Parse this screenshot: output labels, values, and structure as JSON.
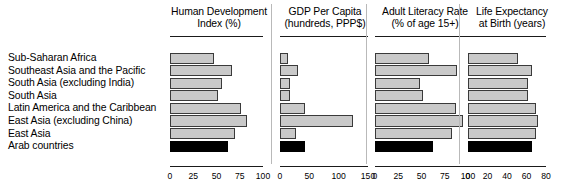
{
  "row_labels": [
    "Sub-Saharan Africa",
    "Southeast Asia and the Pacific",
    "South Asia (excluding India)",
    "South Asia",
    "Latin America and the Caribbean",
    "East Asia (excluding China)",
    "East Asia",
    "Arab countries"
  ],
  "highlight_row": "Arab countries",
  "colors": {
    "bar_fill": "#c9c9c9",
    "bar_border": "#3a3a3a",
    "highlight_fill": "#000000",
    "rule": "#1a1a1a",
    "text": "#000000"
  },
  "chart_data": [
    {
      "type": "bar",
      "title": "Human Development Index (%)",
      "title_lines": [
        "Human Development",
        "Index (%)"
      ],
      "xlabel": "",
      "ylabel": "",
      "orientation": "horizontal",
      "xlim": [
        0,
        100
      ],
      "ticks": [
        0,
        25,
        50,
        75,
        100
      ],
      "tick_labels": [
        "0",
        "25",
        "50",
        "75",
        "100"
      ],
      "grid": false,
      "categories": [
        "Sub-Saharan Africa",
        "Southeast Asia and the Pacific",
        "South Asia (excluding India)",
        "South Asia",
        "Latin America and the Caribbean",
        "East Asia (excluding China)",
        "East Asia",
        "Arab countries"
      ],
      "values": [
        47,
        67,
        56,
        52,
        76,
        83,
        70,
        62
      ]
    },
    {
      "type": "bar",
      "title": "GDP Per Capita (hundreds, PPP$)",
      "title_lines": [
        "GDP Per Capita",
        "(hundreds, PPP$)"
      ],
      "xlabel": "",
      "ylabel": "",
      "orientation": "horizontal",
      "xlim": [
        0,
        150
      ],
      "ticks": [
        0,
        50,
        100,
        150
      ],
      "tick_labels": [
        "0",
        "50",
        "100",
        "150"
      ],
      "grid": false,
      "categories": [
        "Sub-Saharan Africa",
        "Southeast Asia and the Pacific",
        "South Asia (excluding India)",
        "South Asia",
        "Latin America and the Caribbean",
        "East Asia (excluding China)",
        "East Asia",
        "Arab countries"
      ],
      "values": [
        14,
        31,
        17,
        17,
        43,
        125,
        28,
        42
      ]
    },
    {
      "type": "bar",
      "title": "Adult Literacy Rate (% of age 15+)",
      "title_lines": [
        "Adult Literacy Rate",
        "(% of age 15+)"
      ],
      "xlabel": "",
      "ylabel": "",
      "orientation": "horizontal",
      "xlim": [
        0,
        100
      ],
      "ticks": [
        0,
        25,
        50,
        75,
        100
      ],
      "tick_labels": [
        "0",
        "25",
        "50",
        "75",
        "100"
      ],
      "grid": false,
      "categories": [
        "Sub-Saharan Africa",
        "Southeast Asia and the Pacific",
        "South Asia (excluding India)",
        "South Asia",
        "Latin America and the Caribbean",
        "East Asia (excluding China)",
        "East Asia",
        "Arab countries"
      ],
      "values": [
        58,
        88,
        48,
        52,
        87,
        95,
        83,
        62
      ]
    },
    {
      "type": "bar",
      "title": "Life Expectancy at Birth (years)",
      "title_lines": [
        "Life Expectancy",
        "at Birth (years)"
      ],
      "xlabel": "",
      "ylabel": "",
      "orientation": "horizontal",
      "xlim": [
        0,
        80
      ],
      "ticks": [
        0,
        20,
        40,
        60,
        80
      ],
      "tick_labels": [
        "0",
        "20",
        "40",
        "60",
        "80"
      ],
      "grid": false,
      "categories": [
        "Sub-Saharan Africa",
        "Southeast Asia and the Pacific",
        "South Asia (excluding India)",
        "South Asia",
        "Latin America and the Caribbean",
        "East Asia (excluding China)",
        "East Asia",
        "Arab countries"
      ],
      "values": [
        51,
        66,
        62,
        62,
        70,
        72,
        70,
        66
      ]
    }
  ]
}
